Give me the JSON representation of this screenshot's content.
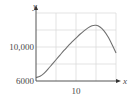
{
  "chart_data": {
    "type": "line",
    "title": "",
    "xlabel": "x",
    "ylabel": "y",
    "xlim": [
      0,
      21
    ],
    "ylim": [
      6000,
      14000
    ],
    "grid": true,
    "x_ticks_labeled": [
      10
    ],
    "y_ticks_labeled": [
      6000,
      10000
    ],
    "x_gridlines": [
      5,
      10,
      15,
      20
    ],
    "y_gridlines": [
      8000,
      10000,
      12000,
      14000
    ],
    "series": [
      {
        "name": "curve",
        "x": [
          0,
          1,
          2,
          3,
          4,
          5,
          6,
          7,
          8,
          9,
          10,
          11,
          12,
          13,
          14,
          15,
          16,
          17,
          18,
          19,
          20
        ],
        "y": [
          6400,
          6550,
          6900,
          7400,
          7950,
          8500,
          9050,
          9600,
          10100,
          10600,
          11050,
          11500,
          11900,
          12250,
          12500,
          12550,
          12350,
          11900,
          11200,
          10300,
          9300
        ]
      }
    ],
    "colors": {
      "curve": "#707070",
      "axis": "#555555",
      "grid": "#dcdcdc"
    }
  },
  "labels": {
    "x_axis": "x",
    "y_axis": "y",
    "x_tick_10": "10",
    "y_tick_6000": "6000",
    "y_tick_10000": "10,000"
  }
}
